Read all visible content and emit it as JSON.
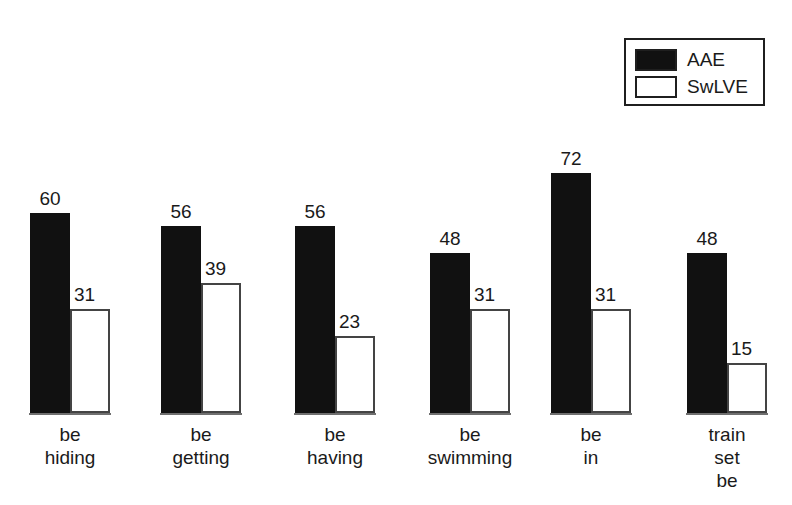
{
  "legend": {
    "entries": [
      {
        "label": "AAE",
        "swatch": "filled",
        "color": "#111111"
      },
      {
        "label": "SwLVE",
        "swatch": "hollow",
        "color": "#ffffff"
      }
    ]
  },
  "chart_data": {
    "type": "bar",
    "title": "",
    "subtitle": "",
    "xlabel": "",
    "ylabel": "",
    "ylim": [
      0,
      80
    ],
    "grid": false,
    "legend_position": "top-right",
    "categories": [
      "be\nhiding",
      "be\ngetting",
      "be\nhaving",
      "be\nswimming",
      "be\nin",
      "train\nset\nbe"
    ],
    "series": [
      {
        "name": "AAE",
        "color": "#111111",
        "values": [
          60,
          56,
          56,
          48,
          72,
          48
        ]
      },
      {
        "name": "SwLVE",
        "color": "#ffffff",
        "values": [
          31,
          39,
          23,
          31,
          31,
          15
        ]
      }
    ],
    "data_labels": [
      {
        "category": "be hiding",
        "AAE": 60,
        "SwLVE": 31
      },
      {
        "category": "be getting",
        "AAE": 56,
        "SwLVE": 39
      },
      {
        "category": "be having",
        "AAE": 56,
        "SwLVE": 23
      },
      {
        "category": "be swimming",
        "AAE": 48,
        "SwLVE": 31
      },
      {
        "category": "be in",
        "AAE": 72,
        "SwLVE": 31
      },
      {
        "category": "train set be",
        "AAE": 48,
        "SwLVE": 15
      }
    ]
  },
  "geometry": {
    "baseline_y": 413,
    "px_per_unit": 3.34,
    "bar_width": 40,
    "group_left_positions": [
      30,
      161,
      295,
      430,
      551,
      687
    ],
    "background": "#ffffff"
  }
}
